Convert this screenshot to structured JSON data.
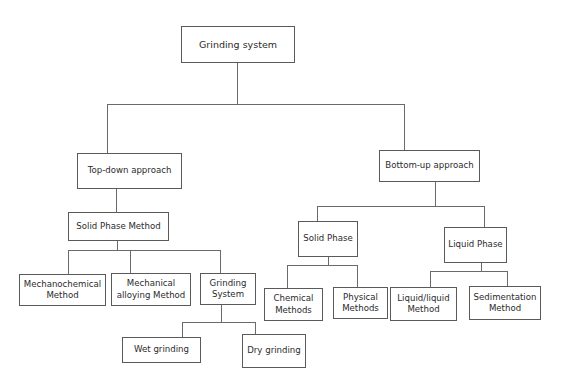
{
  "diagram": {
    "type": "tree",
    "root": {
      "id": "grinding-system",
      "label": "Grinding system"
    },
    "nodes": {
      "top_down": {
        "label": "Top-down approach"
      },
      "bottom_up": {
        "label": "Bottom-up approach"
      },
      "solid_phase_method": {
        "label": "Solid Phase Method"
      },
      "mechanochemical": {
        "label": "Mechanochemical\nMethod"
      },
      "mechanical_alloying": {
        "label": "Mechanical\nalloying Method"
      },
      "grinding_subsystem": {
        "label": "Grinding\nSystem"
      },
      "wet_grinding": {
        "label": "Wet grinding"
      },
      "dry_grinding": {
        "label": "Dry grinding"
      },
      "solid_phase": {
        "label": "Solid Phase"
      },
      "liquid_phase": {
        "label": "Liquid Phase"
      },
      "chemical_methods": {
        "label": "Chemical\nMethods"
      },
      "physical_methods": {
        "label": "Physical\nMethods"
      },
      "liquid_liquid": {
        "label": "Liquid/liquid\nMethod"
      },
      "sedimentation": {
        "label": "Sedimentation\nMethod"
      }
    },
    "edges": [
      [
        "Grinding system",
        "Top-down approach"
      ],
      [
        "Grinding system",
        "Bottom-up approach"
      ],
      [
        "Top-down approach",
        "Solid Phase Method"
      ],
      [
        "Solid Phase Method",
        "Mechanochemical Method"
      ],
      [
        "Solid Phase Method",
        "Mechanical alloying Method"
      ],
      [
        "Solid Phase Method",
        "Grinding System"
      ],
      [
        "Grinding System",
        "Wet grinding"
      ],
      [
        "Grinding System",
        "Dry grinding"
      ],
      [
        "Bottom-up approach",
        "Solid Phase"
      ],
      [
        "Bottom-up approach",
        "Liquid Phase"
      ],
      [
        "Solid Phase",
        "Chemical Methods"
      ],
      [
        "Solid Phase",
        "Physical Methods"
      ],
      [
        "Liquid Phase",
        "Liquid/liquid Method"
      ],
      [
        "Liquid Phase",
        "Sedimentation Method"
      ]
    ],
    "colors": {
      "line": "#6a6a6a",
      "border": "#5a5a5a",
      "text": "#2b2b2b",
      "background": "#ffffff"
    }
  }
}
